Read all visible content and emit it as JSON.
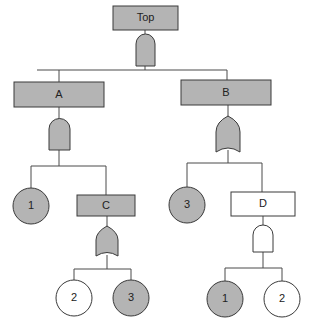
{
  "diagram": {
    "type": "fault-tree",
    "colors": {
      "shaded": "#b4b4b4",
      "white": "#ffffff",
      "stroke": "#3a3a3a"
    },
    "nodes": {
      "top": {
        "label": "Top",
        "kind": "event",
        "fill": "shaded",
        "gate": "AND"
      },
      "a": {
        "label": "A",
        "kind": "event",
        "fill": "shaded",
        "gate": "AND"
      },
      "b": {
        "label": "B",
        "kind": "event",
        "fill": "shaded",
        "gate": "OR"
      },
      "a_basic1": {
        "label": "1",
        "kind": "basic-event",
        "fill": "shaded"
      },
      "c": {
        "label": "C",
        "kind": "event",
        "fill": "shaded",
        "gate": "OR"
      },
      "c_basic2": {
        "label": "2",
        "kind": "basic-event",
        "fill": "white"
      },
      "c_basic3": {
        "label": "3",
        "kind": "basic-event",
        "fill": "shaded"
      },
      "b_basic3": {
        "label": "3",
        "kind": "basic-event",
        "fill": "shaded"
      },
      "d": {
        "label": "D",
        "kind": "event",
        "fill": "white",
        "gate": "AND"
      },
      "d_basic1": {
        "label": "1",
        "kind": "basic-event",
        "fill": "shaded"
      },
      "d_basic2": {
        "label": "2",
        "kind": "basic-event",
        "fill": "white"
      }
    },
    "edges": [
      [
        "top",
        "a"
      ],
      [
        "top",
        "b"
      ],
      [
        "a",
        "a_basic1"
      ],
      [
        "a",
        "c"
      ],
      [
        "c",
        "c_basic2"
      ],
      [
        "c",
        "c_basic3"
      ],
      [
        "b",
        "b_basic3"
      ],
      [
        "b",
        "d"
      ],
      [
        "d",
        "d_basic1"
      ],
      [
        "d",
        "d_basic2"
      ]
    ]
  }
}
